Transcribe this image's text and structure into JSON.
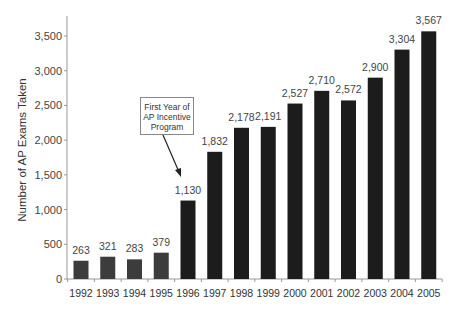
{
  "chart_data": {
    "type": "bar",
    "title": "",
    "xlabel": "",
    "ylabel": "Number of AP Exams Taken",
    "categories": [
      "1992",
      "1993",
      "1994",
      "1995",
      "1996",
      "1997",
      "1998",
      "1999",
      "2000",
      "2001",
      "2002",
      "2003",
      "2004",
      "2005"
    ],
    "values": [
      263,
      321,
      283,
      379,
      1130,
      1832,
      2178,
      2191,
      2527,
      2710,
      2572,
      2900,
      3304,
      3567
    ],
    "value_labels": [
      "263",
      "321",
      "283",
      "379",
      "1,130",
      "1,832",
      "2,178",
      "2,191",
      "2,527",
      "2,710",
      "2,572",
      "2,900",
      "3,304",
      "3,567"
    ],
    "ylim": [
      0,
      3800
    ],
    "yticks": [
      0,
      500,
      1000,
      1500,
      2000,
      2500,
      3000,
      3500
    ],
    "ytick_labels": [
      "0",
      "500",
      "1,000",
      "1,500",
      "2,000",
      "2,500",
      "3,000",
      "3,500"
    ],
    "grid": false,
    "legend": null,
    "bar_colors": {
      "pre_program": "#3c3c3c",
      "post_program": "#1c1c1c"
    },
    "annotations": [
      {
        "text_lines": [
          "First Year of",
          "AP Incentive",
          "Program"
        ],
        "points_to": "1996"
      }
    ]
  },
  "annotation": {
    "line1": "First Year of",
    "line2": "AP Incentive",
    "line3": "Program"
  },
  "axis": {
    "ylabel": "Number of AP Exams Taken"
  }
}
